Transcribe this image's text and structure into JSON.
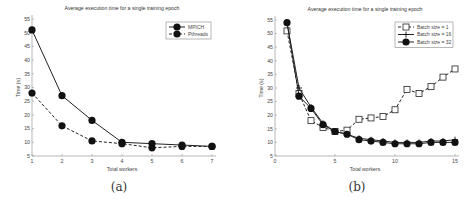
{
  "chart_data": [
    {
      "type": "line",
      "title": "Average execution time for a single training epoch",
      "xlabel": "Total workers",
      "ylabel": "Time (s)",
      "x": [
        1,
        2,
        3,
        4,
        5,
        6,
        7
      ],
      "xticks": [
        "1",
        "2",
        "3",
        "4",
        "5",
        "6",
        "7"
      ],
      "yticks": [
        "5",
        "10",
        "15",
        "20",
        "25",
        "30",
        "35",
        "40",
        "45",
        "50",
        "55"
      ],
      "xlim": [
        1,
        7
      ],
      "ylim": [
        5,
        55
      ],
      "grid": false,
      "legend_position": "upper right",
      "series": [
        {
          "name": "MPICH",
          "style": "solid",
          "marker": "filled-circle",
          "values": [
            51,
            27,
            18,
            10,
            9.5,
            9,
            8.5
          ]
        },
        {
          "name": "Pthreads",
          "style": "dashed",
          "marker": "filled-circle",
          "values": [
            28,
            16,
            10.5,
            9.5,
            8,
            8.5,
            8.5
          ]
        }
      ],
      "caption": "(a)"
    },
    {
      "type": "line",
      "title": "Average execution time for a single training epoch",
      "xlabel": "Total workers",
      "ylabel": "Time (s)",
      "x": [
        1,
        2,
        3,
        4,
        5,
        6,
        7,
        8,
        9,
        10,
        11,
        12,
        13,
        14,
        15
      ],
      "xticks": [
        "0",
        "5",
        "10",
        "15"
      ],
      "yticks": [
        "5",
        "10",
        "15",
        "20",
        "25",
        "30",
        "35",
        "40",
        "45",
        "50",
        "55"
      ],
      "xlim": [
        0,
        15
      ],
      "ylim": [
        5,
        55
      ],
      "grid": false,
      "legend_position": "upper right",
      "series": [
        {
          "name": "Batch size = 1",
          "style": "dashed",
          "marker": "open-square",
          "values": [
            51,
            28,
            18,
            15.5,
            14,
            14.5,
            18.5,
            19,
            19.5,
            22,
            29.5,
            28,
            30.5,
            34,
            37
          ]
        },
        {
          "name": "Batch size = 16",
          "style": "solid",
          "marker": "plus",
          "values": [
            54,
            30,
            23,
            17,
            14,
            13,
            11.5,
            11,
            10.5,
            10,
            10,
            10,
            10.5,
            10.5,
            11
          ]
        },
        {
          "name": "Batch size = 32",
          "style": "solid",
          "marker": "filled-circle",
          "values": [
            54,
            27,
            22.5,
            16.5,
            14,
            13,
            11,
            10.5,
            10,
            9.5,
            9.5,
            9.5,
            10,
            10,
            10
          ]
        }
      ],
      "caption": "(b)"
    }
  ]
}
